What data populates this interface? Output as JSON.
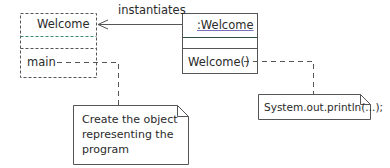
{
  "diagram": {
    "type": "UML class/object diagram",
    "class_box": {
      "name": "Welcome",
      "attributes": [],
      "operations": [
        "main"
      ],
      "style": "dashed"
    },
    "object_box": {
      "name": ":Welcome",
      "attributes": [],
      "operations": [
        "Welcome()"
      ],
      "style": "solid"
    },
    "association": {
      "label": "instantiates",
      "from": ":Welcome",
      "to": "Welcome"
    },
    "notes": [
      {
        "id": "main-note",
        "lines": [
          "Create the object",
          "representing the",
          "program"
        ],
        "attached_to": "main"
      },
      {
        "id": "ctor-note",
        "lines": [
          "System.out.println(...);"
        ],
        "attached_to": "Welcome()"
      }
    ],
    "colors": {
      "line": "#444444",
      "text": "#2a2a2a",
      "underline": "#7a6fc0",
      "divider_accent": "#3a8a6a"
    }
  }
}
